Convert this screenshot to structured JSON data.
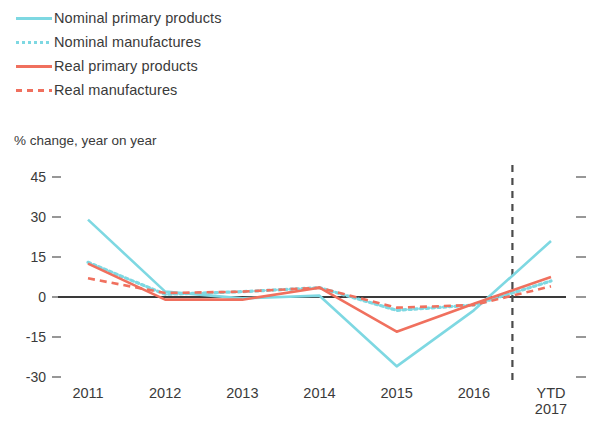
{
  "legend": {
    "items": [
      {
        "label": "Nominal primary products",
        "color": "#7ed8e2",
        "style": "solid",
        "icon": "legend-line-solid-icon"
      },
      {
        "label": "Nominal manufactures",
        "color": "#7ed8e2",
        "style": "dotted",
        "icon": "legend-line-dotted-icon"
      },
      {
        "label": "Real primary products",
        "color": "#f0705e",
        "style": "solid",
        "icon": "legend-line-solid-icon"
      },
      {
        "label": "Real manufactures",
        "color": "#f0705e",
        "style": "dashed",
        "icon": "legend-line-dashed-icon"
      }
    ]
  },
  "subtitle": "% change, year on year",
  "chart_data": {
    "type": "line",
    "title": "",
    "subtitle": "% change, year on year",
    "xlabel": "",
    "ylabel": "% change, year on year",
    "categories": [
      "2011",
      "2012",
      "2013",
      "2014",
      "2015",
      "2016",
      "YTD\n2017"
    ],
    "x_tick_labels": [
      "2011",
      "2012",
      "2013",
      "2014",
      "2015",
      "2016",
      "YTD 2017"
    ],
    "y_tick_labels": [
      "45",
      "30",
      "15",
      "0",
      "-15",
      "-30"
    ],
    "y_ticks": [
      45,
      30,
      15,
      0,
      -15,
      -30
    ],
    "ylim": [
      -36,
      48
    ],
    "grid": false,
    "zero_line": true,
    "zero_line_color": "#3a3a3a",
    "legend_position": "above-plot-left",
    "annotations": [
      {
        "name": "forecast-divider",
        "type": "vertical-dashed-line",
        "x_between": [
          "2016",
          "YTD 2017"
        ],
        "color": "#4a4a4a"
      }
    ],
    "series": [
      {
        "name": "Nominal primary products",
        "color": "#7ed8e2",
        "style": "solid",
        "values": [
          29,
          2,
          -0.5,
          0.5,
          -26,
          -5,
          21
        ]
      },
      {
        "name": "Nominal manufactures",
        "color": "#7ed8e2",
        "style": "dotted",
        "values": [
          13,
          1,
          2,
          3.5,
          -5,
          -3,
          6
        ]
      },
      {
        "name": "Real primary products",
        "color": "#f0705e",
        "style": "solid",
        "values": [
          12.5,
          -1,
          -1,
          3.5,
          -13,
          -2.5,
          7.5
        ]
      },
      {
        "name": "Real manufactures",
        "color": "#f0705e",
        "style": "dashed",
        "values": [
          7,
          1.5,
          2,
          3.5,
          -4,
          -3,
          4
        ]
      }
    ]
  },
  "axes": {
    "y_ticks": [
      {
        "label": "45",
        "value": 45
      },
      {
        "label": "30",
        "value": 30
      },
      {
        "label": "15",
        "value": 15
      },
      {
        "label": "0",
        "value": 0
      },
      {
        "label": "-15",
        "value": -15
      },
      {
        "label": "-30",
        "value": -30
      }
    ],
    "x_ticks": [
      {
        "label": "2011"
      },
      {
        "label": "2012"
      },
      {
        "label": "2013"
      },
      {
        "label": "2014"
      },
      {
        "label": "2015"
      },
      {
        "label": "2016"
      },
      {
        "label": "YTD\n2017"
      }
    ]
  }
}
